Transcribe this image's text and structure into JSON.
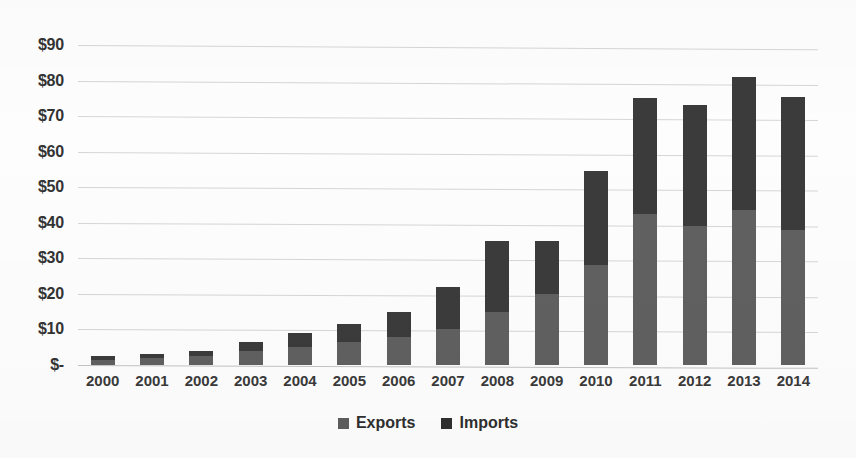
{
  "chart_data": {
    "type": "bar",
    "subtype": "stacked-bar",
    "title": "",
    "subtitle": "",
    "xlabel": "",
    "ylabel": "",
    "categories": [
      "2000",
      "2001",
      "2002",
      "2003",
      "2004",
      "2005",
      "2006",
      "2007",
      "2008",
      "2009",
      "2010",
      "2011",
      "2012",
      "2013",
      "2014"
    ],
    "series": [
      {
        "name": "Exports",
        "color": "#606060",
        "values": [
          1.5,
          2.0,
          2.5,
          4.0,
          5.0,
          6.5,
          8.0,
          10.0,
          15.0,
          20.0,
          28.0,
          42.5,
          39.0,
          43.5,
          38.0
        ]
      },
      {
        "name": "Imports",
        "color": "#3b3b3b",
        "values": [
          1.0,
          1.0,
          1.5,
          2.5,
          4.0,
          5.0,
          7.0,
          12.0,
          20.0,
          15.0,
          26.5,
          32.5,
          34.0,
          37.5,
          37.5
        ]
      }
    ],
    "totals": [
      2.5,
      3.0,
      4.0,
      6.5,
      9.0,
      11.5,
      15.0,
      22.0,
      35.0,
      35.0,
      54.5,
      75.0,
      73.0,
      81.0,
      75.5
    ],
    "ylim": [
      0,
      90
    ],
    "y_ticks": [
      0,
      10,
      20,
      30,
      40,
      50,
      60,
      70,
      80,
      90
    ],
    "y_tick_labels": [
      "$-",
      "$10",
      "$20",
      "$30",
      "$40",
      "$50",
      "$60",
      "$70",
      "$80",
      "$90"
    ],
    "grid": true,
    "grid_axis": "y",
    "legend": true,
    "legend_position": "bottom",
    "legend_entries": [
      "Exports",
      "Imports"
    ]
  },
  "legend": {
    "exports_label": "Exports",
    "imports_label": "Imports"
  },
  "colors": {
    "exports": "#606060",
    "imports": "#3b3b3b",
    "gridline": "#cfcfcf",
    "background": "#fdfdfd"
  }
}
